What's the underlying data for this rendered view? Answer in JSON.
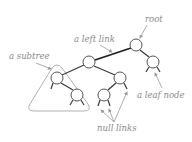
{
  "diagram": {
    "type": "binary-tree-anatomy",
    "labels": {
      "root": "root",
      "left_link": "a left link",
      "subtree": "a subtree",
      "leaf_node": "a leaf node",
      "null_links": "null links"
    },
    "colors": {
      "label": "#8a8a8a",
      "edge": "#3a3a3a",
      "node_stroke": "#555555",
      "subtree_outline": "#a8a8a8",
      "arrow": "#9a9a9a"
    },
    "nodes": [
      {
        "id": "root",
        "x": 136,
        "y": 45
      },
      {
        "id": "r-leaf",
        "x": 153,
        "y": 62
      },
      {
        "id": "l",
        "x": 89,
        "y": 62
      },
      {
        "id": "ll",
        "x": 57,
        "y": 78
      },
      {
        "id": "lr",
        "x": 120,
        "y": 78
      },
      {
        "id": "llr",
        "x": 77,
        "y": 95
      },
      {
        "id": "lrl",
        "x": 104,
        "y": 95
      }
    ]
  }
}
